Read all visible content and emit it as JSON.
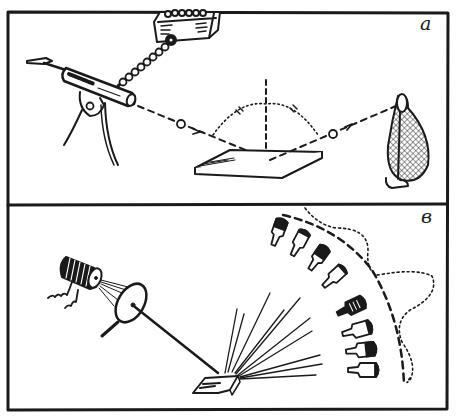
{
  "figure": {
    "panels": [
      {
        "id": "a",
        "label": "a",
        "description": "Gun shooting balls at a plate; balls bounce off at equal angles into a net bag",
        "elements": [
          "ammo-box",
          "ball-chain",
          "gun-on-stand",
          "dashed-trajectory",
          "ball",
          "normal-line",
          "angle-arc",
          "plate",
          "net-bag"
        ]
      },
      {
        "id": "b",
        "label": "в",
        "description": "Light from a coil lamp through a diaphragm onto a rough surface, scattering rays toward bottles in an arc",
        "elements": [
          "lamp-coil",
          "diaphragm",
          "light-beam",
          "rough-surface",
          "scattered-rays",
          "bottles",
          "dashed-arc",
          "dotted-outline"
        ]
      }
    ],
    "colors": {
      "ink": "#1a1a1a",
      "paper": "#ffffff"
    }
  }
}
